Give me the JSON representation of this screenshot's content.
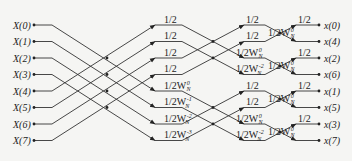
{
  "diagram": {
    "type": "FFT butterfly (8-point, decimation-in-frequency style, inverse scaling 1/2)",
    "inputs": [
      "X(0)",
      "X(1)",
      "X(2)",
      "X(3)",
      "X(4)",
      "X(5)",
      "X(6)",
      "X(7)"
    ],
    "outputs": [
      "x(0)",
      "x(4)",
      "x(2)",
      "x(6)",
      "x(1)",
      "x(5)",
      "x(3)",
      "x(7)"
    ],
    "stage1_labels": [
      {
        "base": "1/2",
        "exp": ""
      },
      {
        "base": "1/2",
        "exp": ""
      },
      {
        "base": "1/2",
        "exp": ""
      },
      {
        "base": "1/2",
        "exp": ""
      },
      {
        "base": "1/2W",
        "sub": "N",
        "exp": "0"
      },
      {
        "base": "1/2W",
        "sub": "N",
        "exp": "-1"
      },
      {
        "base": "1/2W",
        "sub": "N",
        "exp": "-2"
      },
      {
        "base": "1/2W",
        "sub": "N",
        "exp": "-3"
      }
    ],
    "stage2_labels": [
      {
        "base": "1/2",
        "exp": ""
      },
      {
        "base": "1/2",
        "exp": ""
      },
      {
        "base": "1/2W",
        "sub": "N",
        "exp": "0"
      },
      {
        "base": "1/2W",
        "sub": "N",
        "exp": "-2"
      },
      {
        "base": "1/2",
        "exp": ""
      },
      {
        "base": "1/2",
        "exp": ""
      },
      {
        "base": "1/2W",
        "sub": "N",
        "exp": "0"
      },
      {
        "base": "1/2W",
        "sub": "N",
        "exp": "-2"
      }
    ],
    "stage3_labels": [
      {
        "base": "1/2",
        "exp": ""
      },
      {
        "base": "1/2W",
        "sub": "N",
        "exp": "0"
      },
      {
        "base": "1/2",
        "exp": ""
      },
      {
        "base": "1/2W",
        "sub": "N",
        "exp": "0"
      },
      {
        "base": "1/2",
        "exp": ""
      },
      {
        "base": "1/2W",
        "sub": "N",
        "exp": "0"
      },
      {
        "base": "1/2",
        "exp": ""
      },
      {
        "base": "1/2W",
        "sub": "N",
        "exp": "0"
      }
    ],
    "colors": {
      "line": "#333333",
      "text": "#222222",
      "background": "#f5f5f3"
    }
  }
}
